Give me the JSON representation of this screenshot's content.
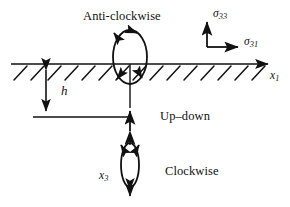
{
  "figure": {
    "type": "mechanics-schematic",
    "background_color": "#ffffff",
    "ink_color": "#111111"
  },
  "labels": {
    "anticlockwise": "Anti-clockwise",
    "updown": "Up–down",
    "clockwise": "Clockwise",
    "depth": "h",
    "axis_x1_base": "x",
    "axis_x1_sub": "1",
    "axis_x3_base": "x",
    "axis_x3_sub": "3",
    "stress_normal_base": "σ",
    "stress_normal_sub": "33",
    "stress_shear_base": "σ",
    "stress_shear_sub": "31"
  },
  "geometry": {
    "surface_line_y": 64,
    "surface_line_x_start": 11,
    "surface_line_x_end": 272,
    "hatch_count": 15,
    "source_axis_x": 130,
    "depth_arrow_x": 46,
    "depth_arrow_top": 64,
    "depth_arrow_bottom": 117,
    "reference_line_y": 117,
    "reference_line_x_start": 33,
    "reference_line_x_end": 130,
    "anticlockwise_ellipse_cx": 130,
    "anticlockwise_ellipse_cy": 57,
    "anticlockwise_ellipse_rx": 17,
    "anticlockwise_ellipse_ry": 27,
    "clockwise_ellipse_cx": 130,
    "clockwise_ellipse_cy": 165,
    "clockwise_ellipse_rx": 9,
    "clockwise_ellipse_ry": 22,
    "stress_origin_x": 207,
    "stress_origin_y": 47,
    "stress_normal_tip_y": 20,
    "stress_shear_tip_x": 240
  }
}
